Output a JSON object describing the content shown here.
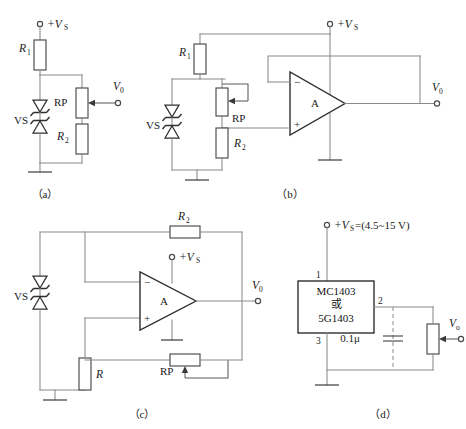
{
  "figure": {
    "caption_a": "（a）",
    "caption_b": "（b）",
    "caption_c": "（c）",
    "caption_d": "（d）"
  },
  "colors": {
    "wire": "#8a8a8a",
    "component": "#4a4a4a",
    "text": "#1a1a1a",
    "background": "#ffffff"
  },
  "circuit_a": {
    "supply_label": "+V",
    "supply_sub": "S",
    "r1_label": "R",
    "r1_sub": "1",
    "r2_label": "R",
    "r2_sub": "2",
    "rp_label": "RP",
    "vs_label": "VS",
    "out_label": "V",
    "out_sub": "0"
  },
  "circuit_b": {
    "supply_label": "+V",
    "supply_sub": "S",
    "r1_label": "R",
    "r1_sub": "1",
    "r2_label": "R",
    "r2_sub": "2",
    "rp_label": "RP",
    "vs_label": "VS",
    "opamp_label": "A",
    "minus_label": "−",
    "plus_label": "+",
    "out_label": "V",
    "out_sub": "0"
  },
  "circuit_c": {
    "supply_label": "+V",
    "supply_sub": "S",
    "r2_label": "R",
    "r2_sub": "2",
    "r_label": "R",
    "rp_label": "RP",
    "vs_label": "VS",
    "opamp_label": "A",
    "minus_label": "−",
    "plus_label": "+",
    "out_label": "V",
    "out_sub": "0"
  },
  "circuit_d": {
    "supply_label": "+V",
    "supply_sub": "S",
    "supply_value": "=(4.5~15 V)",
    "ic_line1": "MC1403",
    "ic_line2": "或",
    "ic_line3": "5G1403",
    "pin1": "1",
    "pin2": "2",
    "pin3": "3",
    "cap_label": "0.1μ",
    "out_label": "V",
    "out_sub": "o"
  }
}
